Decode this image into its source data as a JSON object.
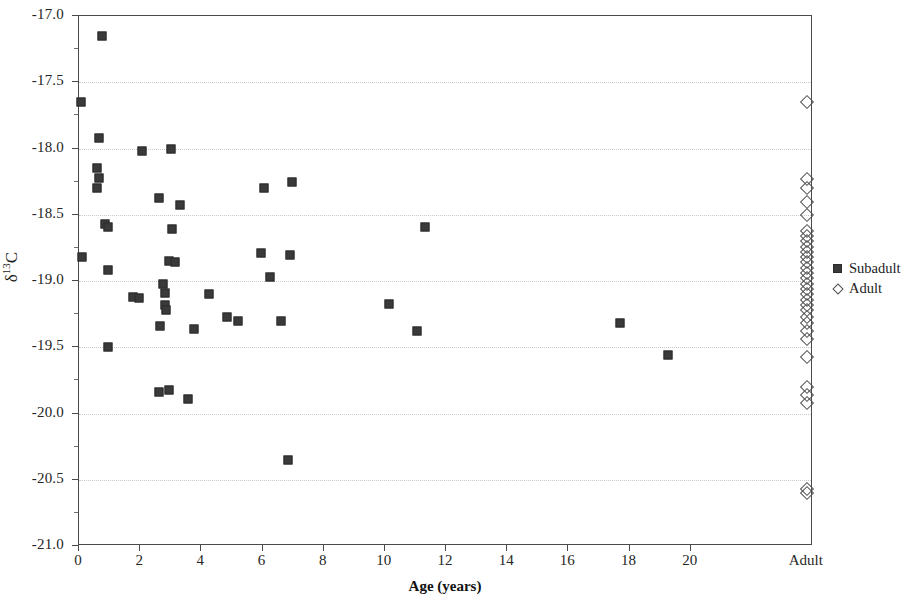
{
  "chart_data": {
    "type": "scatter",
    "title": "",
    "xlabel": "Age (years)",
    "ylabel": "δ¹³C",
    "ylabel_base": "δ",
    "ylabel_sup": "13",
    "ylabel_tail": "C",
    "xlim": [
      0,
      24
    ],
    "ylim": [
      -21.0,
      -17.0
    ],
    "grid": true,
    "grid_axis": "y",
    "legend_position": "right",
    "x_tick_labels": [
      "0",
      "2",
      "4",
      "6",
      "8",
      "10",
      "12",
      "14",
      "16",
      "18",
      "20",
      "Adult"
    ],
    "x_tick_values": [
      0,
      2,
      4,
      6,
      8,
      10,
      12,
      14,
      16,
      18,
      20,
      23.8
    ],
    "y_tick_labels": [
      "-17.0",
      "-17.5",
      "-18.0",
      "-18.5",
      "-19.0",
      "-19.5",
      "-20.0",
      "-20.5",
      "-21.0"
    ],
    "y_tick_values": [
      -17.0,
      -17.5,
      -18.0,
      -18.5,
      -19.0,
      -19.5,
      -20.0,
      -20.5,
      -21.0
    ],
    "series": [
      {
        "name": "Subadult",
        "marker": "filled-square",
        "color": "#3a3a3a",
        "points": [
          [
            0.75,
            -17.15
          ],
          [
            0.05,
            -17.65
          ],
          [
            0.65,
            -17.92
          ],
          [
            2.05,
            -18.02
          ],
          [
            3.0,
            -18.0
          ],
          [
            0.6,
            -18.15
          ],
          [
            0.65,
            -18.22
          ],
          [
            0.6,
            -18.3
          ],
          [
            2.6,
            -18.37
          ],
          [
            6.05,
            -18.3
          ],
          [
            6.95,
            -18.25
          ],
          [
            3.3,
            -18.43
          ],
          [
            0.85,
            -18.57
          ],
          [
            0.95,
            -18.59
          ],
          [
            3.05,
            -18.61
          ],
          [
            11.3,
            -18.59
          ],
          [
            0.1,
            -18.82
          ],
          [
            2.95,
            -18.85
          ],
          [
            3.15,
            -18.86
          ],
          [
            0.95,
            -18.92
          ],
          [
            5.95,
            -18.79
          ],
          [
            6.9,
            -18.8
          ],
          [
            6.25,
            -18.97
          ],
          [
            1.75,
            -19.12
          ],
          [
            1.95,
            -19.13
          ],
          [
            2.75,
            -19.02
          ],
          [
            2.8,
            -19.09
          ],
          [
            2.8,
            -19.18
          ],
          [
            2.85,
            -19.22
          ],
          [
            4.25,
            -19.1
          ],
          [
            10.15,
            -19.17
          ],
          [
            2.65,
            -19.34
          ],
          [
            3.75,
            -19.36
          ],
          [
            4.85,
            -19.27
          ],
          [
            5.2,
            -19.3
          ],
          [
            6.6,
            -19.3
          ],
          [
            11.05,
            -19.38
          ],
          [
            17.7,
            -19.32
          ],
          [
            0.95,
            -19.5
          ],
          [
            2.6,
            -19.84
          ],
          [
            2.95,
            -19.82
          ],
          [
            3.55,
            -19.89
          ],
          [
            19.25,
            -19.56
          ],
          [
            6.85,
            -20.35
          ]
        ]
      },
      {
        "name": "Adult",
        "marker": "open-diamond",
        "color": "#4f4f4f",
        "x_category": "Adult",
        "values": [
          -17.65,
          -18.23,
          -18.3,
          -18.4,
          -18.5,
          -18.62,
          -18.66,
          -18.7,
          -18.74,
          -18.78,
          -18.82,
          -18.86,
          -18.9,
          -18.94,
          -18.98,
          -19.02,
          -19.06,
          -19.1,
          -19.14,
          -19.18,
          -19.22,
          -19.27,
          -19.32,
          -19.38,
          -19.44,
          -19.57,
          -19.8,
          -19.86,
          -19.92,
          -20.57,
          -20.6
        ]
      }
    ]
  },
  "legend": {
    "items": [
      {
        "label": "Subadult",
        "marker": "filled-square-icon"
      },
      {
        "label": "Adult",
        "marker": "open-diamond-icon"
      }
    ]
  }
}
